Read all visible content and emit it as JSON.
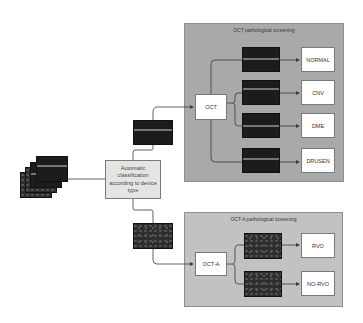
{
  "diagram": {
    "input": {
      "label": "",
      "icon": "oct-image-stack"
    },
    "central_node": {
      "label": "Automatic classification according to device type"
    },
    "branches": [
      {
        "device": "OCT",
        "panel_title": "OCT pathological screening",
        "classes": [
          "NORMAL",
          "CNV",
          "DME",
          "DRUSEN"
        ]
      },
      {
        "device": "OCT-A",
        "panel_title": "OCT-A pathological screening",
        "classes": [
          "RVO",
          "NO-RVO"
        ]
      }
    ]
  },
  "colors": {
    "oct_panel": "#a9a9a9",
    "octa_panel": "#c2c2c2",
    "central_node": "#e4e4e4",
    "arrow": "#3a3a3a"
  }
}
